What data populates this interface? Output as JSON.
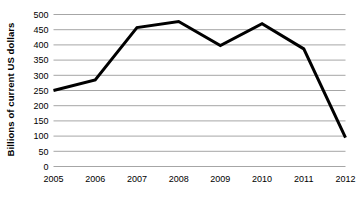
{
  "chart_data": {
    "type": "line",
    "title": "",
    "xlabel": "",
    "ylabel": "Billions of current US dollars",
    "categories": [
      "2005",
      "2006",
      "2007",
      "2008",
      "2009",
      "2010",
      "2011",
      "2012"
    ],
    "values": [
      250,
      285,
      457,
      477,
      398,
      470,
      387,
      95
    ],
    "series": [
      {
        "name": "Billions of current US dollars",
        "values": [
          250,
          285,
          457,
          477,
          398,
          470,
          387,
          95
        ],
        "color": "#000000"
      }
    ],
    "ylim": [
      0,
      500
    ],
    "yticks": [
      0,
      50,
      100,
      150,
      200,
      250,
      300,
      350,
      400,
      450,
      500
    ],
    "ytick_labels": [
      "0",
      "50",
      "100",
      "150",
      "200",
      "250",
      "300",
      "350",
      "400",
      "450",
      "500"
    ],
    "xtick_labels": [
      "2005",
      "2006",
      "2007",
      "2008",
      "2009",
      "2010",
      "2011",
      "2012"
    ],
    "grid": true,
    "grid_axis": "y",
    "grid_color": "#a6a6a6",
    "legend": false,
    "legend_position": "none",
    "line_color": "#000000",
    "line_width": 3,
    "markers": false,
    "background_color": "#ffffff"
  }
}
